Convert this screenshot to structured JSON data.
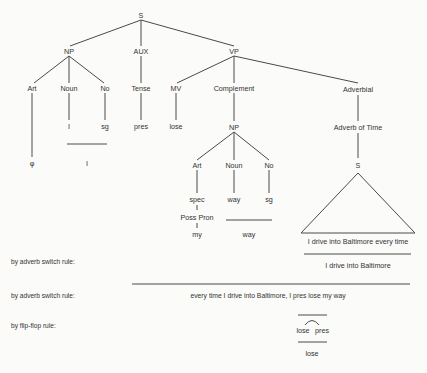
{
  "diagram": {
    "type": "syntax-tree",
    "nodes": {
      "s_root": "S",
      "np": "NP",
      "aux": "AUX",
      "vp": "VP",
      "np_art": "Art",
      "np_noun": "Noun",
      "np_no": "No",
      "aux_tense": "Tense",
      "vp_mv": "MV",
      "vp_complement": "Complement",
      "vp_adverbial": "Adverbial",
      "np_noun_val": "I",
      "np_no_val": "sg",
      "tense_val": "pres",
      "mv_val": "lose",
      "art_val": "φ",
      "np_result": "I",
      "comp_np": "NP",
      "comp_art": "Art",
      "comp_noun": "Noun",
      "comp_no": "No",
      "comp_spec": "spec",
      "comp_poss_pron": "Poss Pron",
      "comp_my": "my",
      "comp_noun_val": "way",
      "comp_no_val": "sg",
      "comp_way_result": "way",
      "adverb_of_time": "Adverb of Time",
      "embedded_s": "S",
      "embedded_sentence": "I drive into Baltimore every time",
      "embedded_result": "I drive into Baltimore"
    },
    "rules": [
      {
        "label": "by adverb switch rule:"
      },
      {
        "label": "by adverb switch rule:",
        "result": "every time I drive into Baltimore, I pres lose my way"
      },
      {
        "label": "by flip-flop rule:",
        "left": "lose",
        "right": "pres",
        "result": "lose"
      }
    ]
  }
}
